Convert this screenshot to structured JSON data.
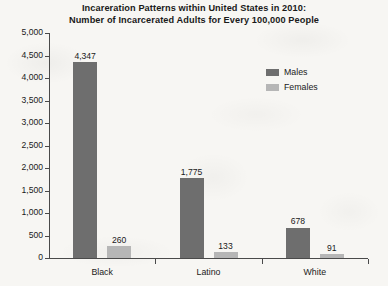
{
  "chart_data": {
    "type": "bar",
    "title": "Incareration Patterns within United States in 2010: Number of Incarcerated Adults for Every 100,000 People",
    "title_line1": "Incareration Patterns within United States in 2010:",
    "title_line2": "Number of Incarcerated Adults for Every 100,000 People",
    "xlabel": "",
    "ylabel": "",
    "categories": [
      "Black",
      "Latino",
      "White"
    ],
    "series": [
      {
        "name": "Males",
        "color": "#6e6e6e",
        "values": [
          4347,
          1775,
          678
        ],
        "value_labels": [
          "4,347",
          "1,775",
          "678"
        ]
      },
      {
        "name": "Females",
        "color": "#b6b6b6",
        "values": [
          260,
          133,
          91
        ],
        "value_labels": [
          "260",
          "133",
          "91"
        ]
      }
    ],
    "ylim": [
      0,
      5000
    ],
    "y_tick_step": 500,
    "y_ticks": [
      5000,
      4500,
      4000,
      3500,
      3000,
      2500,
      2000,
      1500,
      1000,
      500,
      0
    ],
    "y_tick_labels": [
      "5,000",
      "4,500",
      "4,000",
      "3,500",
      "3,000",
      "2,500",
      "2,000",
      "1,500",
      "1,000",
      "500",
      "0"
    ],
    "grid": false,
    "legend_position": "top-right"
  },
  "legend": {
    "entries": [
      {
        "label": "Males",
        "color": "#6e6e6e"
      },
      {
        "label": "Females",
        "color": "#b6b6b6"
      }
    ]
  },
  "colors": {
    "males": "#6e6e6e",
    "females": "#b6b6b6",
    "axis": "#4a4a4a",
    "text": "#1a1a1a",
    "background": "#f7f6f3"
  }
}
